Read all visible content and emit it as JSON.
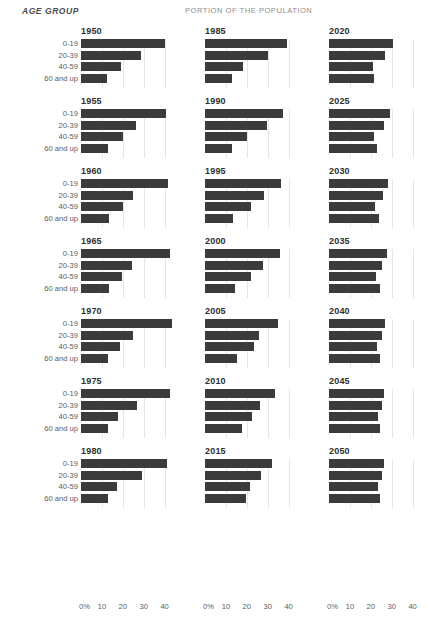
{
  "header": {
    "age_group_label": "AGE GROUP",
    "portion_label": "PORTION OF THE POPULATION"
  },
  "axis": {
    "ticks": [
      "0%",
      "10",
      "20",
      "30",
      "40"
    ],
    "tick_values": [
      0,
      10,
      20,
      30,
      40
    ],
    "min": 0,
    "max": 44
  },
  "age_groups": [
    "0-19",
    "20-39",
    "40-59",
    "60 and up"
  ],
  "chart_data": {
    "type": "bar",
    "title": "PORTION OF THE POPULATION",
    "subtitle": "AGE GROUP",
    "xlabel": "",
    "ylabel": "AGE GROUP",
    "xlim": [
      0,
      44
    ],
    "grid": true,
    "legend": "none",
    "orientation": "horizontal",
    "small_multiples": true,
    "layout": {
      "columns": 3,
      "rows": 7
    },
    "categories": [
      "0-19",
      "20-39",
      "40-59",
      "60 and up"
    ],
    "xticks": [
      0,
      10,
      20,
      30,
      40
    ],
    "xticklabels": [
      "0%",
      "10",
      "20",
      "30",
      "40"
    ],
    "units": "percent",
    "panels": [
      {
        "year": "1950",
        "values": [
          40.0,
          28.5,
          19.0,
          12.5
        ]
      },
      {
        "year": "1955",
        "values": [
          40.5,
          26.5,
          20.0,
          13.0
        ]
      },
      {
        "year": "1960",
        "values": [
          41.5,
          25.0,
          20.0,
          13.5
        ]
      },
      {
        "year": "1965",
        "values": [
          42.5,
          24.5,
          19.5,
          13.5
        ]
      },
      {
        "year": "1970",
        "values": [
          43.5,
          25.0,
          18.5,
          13.0
        ]
      },
      {
        "year": "1975",
        "values": [
          42.5,
          27.0,
          17.5,
          13.0
        ]
      },
      {
        "year": "1980",
        "values": [
          41.0,
          29.0,
          17.0,
          13.0
        ]
      },
      {
        "year": "1985",
        "values": [
          39.0,
          30.0,
          18.0,
          13.0
        ]
      },
      {
        "year": "1990",
        "values": [
          37.5,
          29.5,
          20.0,
          13.0
        ]
      },
      {
        "year": "1995",
        "values": [
          36.5,
          28.0,
          22.0,
          13.5
        ]
      },
      {
        "year": "2000",
        "values": [
          36.0,
          27.5,
          22.0,
          14.5
        ]
      },
      {
        "year": "2005",
        "values": [
          35.0,
          26.0,
          23.5,
          15.5
        ]
      },
      {
        "year": "2010",
        "values": [
          33.5,
          26.5,
          22.5,
          17.5
        ]
      },
      {
        "year": "2015",
        "values": [
          32.0,
          27.0,
          21.5,
          19.5
        ]
      },
      {
        "year": "2020",
        "values": [
          30.5,
          27.0,
          21.0,
          21.5
        ]
      },
      {
        "year": "2025",
        "values": [
          29.0,
          26.5,
          21.5,
          23.0
        ]
      },
      {
        "year": "2030",
        "values": [
          28.0,
          26.0,
          22.0,
          24.0
        ]
      },
      {
        "year": "2035",
        "values": [
          27.5,
          25.5,
          22.5,
          24.5
        ]
      },
      {
        "year": "2040",
        "values": [
          27.0,
          25.5,
          23.0,
          24.5
        ]
      },
      {
        "year": "2045",
        "values": [
          26.5,
          25.5,
          23.5,
          24.5
        ]
      },
      {
        "year": "2050",
        "values": [
          26.5,
          25.5,
          23.5,
          24.5
        ]
      }
    ]
  }
}
